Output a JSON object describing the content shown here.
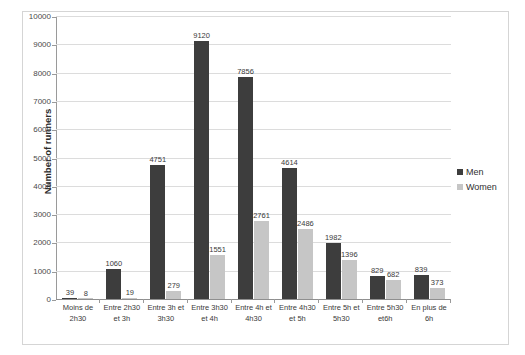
{
  "chart_data": {
    "type": "bar",
    "title": "",
    "xlabel": "",
    "ylabel": "Number of runners",
    "ylim": [
      0,
      10000
    ],
    "ytick_step": 1000,
    "yticks": [
      "0",
      "1000",
      "2000",
      "3000",
      "4000",
      "5000",
      "6000",
      "7000",
      "8000",
      "9000",
      "10000"
    ],
    "grid": true,
    "legend_position": "right",
    "categories": [
      "Moins de 2h30",
      "Entre 2h30 et 3h",
      "Entre 3h et 3h30",
      "Entre 3h30 et 4h",
      "Entre 4h et 4h30",
      "Entre 4h30 et 5h",
      "Entre 5h et 5h30",
      "Entre 5h30 et 6h",
      "En plus de 6h"
    ],
    "category_lines": [
      [
        "Moins de",
        "2h30"
      ],
      [
        "Entre 2h30",
        "et 3h"
      ],
      [
        "Entre 3h et",
        "3h30"
      ],
      [
        "Entre 3h30",
        "et 4h"
      ],
      [
        "Entre 4h et",
        "4h30"
      ],
      [
        "Entre 4h30",
        "et 5h"
      ],
      [
        "Entre 5h et",
        "5h30"
      ],
      [
        "Entre 5h30",
        "et6h"
      ],
      [
        "En plus de",
        "6h"
      ]
    ],
    "series": [
      {
        "name": "Men",
        "color": "#3d3d3d",
        "values": [
          39,
          1060,
          4751,
          9120,
          7856,
          4614,
          1982,
          829,
          839
        ]
      },
      {
        "name": "Women",
        "color": "#c6c6c6",
        "values": [
          8,
          19,
          279,
          1551,
          2761,
          2486,
          1396,
          682,
          373
        ]
      }
    ]
  },
  "legend": {
    "items": [
      {
        "label": "Men",
        "swatch": "legend-swatch-men"
      },
      {
        "label": "Women",
        "swatch": "legend-swatch-women"
      }
    ]
  },
  "axes": {
    "y_title": "Number of runners"
  }
}
